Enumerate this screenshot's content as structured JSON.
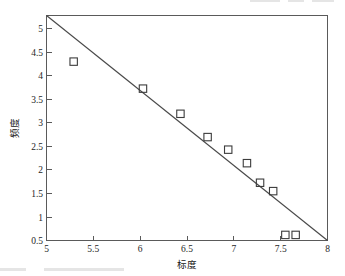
{
  "chart_data": {
    "type": "scatter",
    "title": "",
    "xlabel": "标度",
    "ylabel": "频度",
    "xlim": [
      5,
      8
    ],
    "ylim": [
      0.5,
      5.33
    ],
    "grid": false,
    "legend": "none",
    "x_ticks": [
      "5",
      "5.5",
      "6",
      "6.5",
      "7",
      "7.5",
      "8"
    ],
    "x_tick_values": [
      5,
      5.5,
      6,
      6.5,
      7,
      7.5,
      8
    ],
    "y_ticks": [
      "0.5",
      "1",
      "1.5",
      "2",
      "2.5",
      "3",
      "3.5",
      "4",
      "4.5",
      "5"
    ],
    "y_tick_values": [
      0.5,
      1,
      1.5,
      2,
      2.5,
      3,
      3.5,
      4,
      4.5,
      5
    ],
    "series": [
      {
        "name": "观测点",
        "marker": "square-open",
        "x": [
          5.29,
          6.03,
          6.43,
          6.72,
          6.94,
          7.14,
          7.28,
          7.42,
          7.55,
          7.66
        ],
        "y": [
          4.34,
          3.76,
          3.22,
          2.72,
          2.45,
          2.16,
          1.74,
          1.56,
          0.62,
          0.62
        ]
      }
    ],
    "fit_line": {
      "name": "拟合直线",
      "x": [
        5.0,
        8.0
      ],
      "y": [
        5.33,
        0.5
      ]
    }
  },
  "axis": {
    "x_title": "标度",
    "y_title": "频度"
  }
}
